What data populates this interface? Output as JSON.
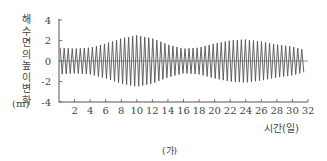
{
  "chart_data": {
    "type": "line",
    "title": "",
    "caption": "(가)",
    "xlabel": "시간(일)",
    "ylabel": "해수면의 높이 변화",
    "ylabel_unit": "(m)",
    "xlim": [
      0,
      32
    ],
    "ylim": [
      -4,
      4
    ],
    "x_ticks": [
      2,
      4,
      6,
      8,
      10,
      12,
      14,
      16,
      18,
      20,
      22,
      24,
      26,
      28,
      30,
      32
    ],
    "y_ticks": [
      4,
      2,
      0,
      -2,
      -4
    ],
    "grid": false,
    "zero_line": true,
    "series": [
      {
        "name": "해수면의 높이 변화",
        "envelope": {
          "x": [
            0,
            2,
            4,
            6,
            8,
            10,
            12,
            14,
            16,
            18,
            20,
            22,
            24,
            26,
            28,
            30,
            31.5
          ],
          "amplitude": [
            1.3,
            1.2,
            1.3,
            1.7,
            2.2,
            2.5,
            2.2,
            1.6,
            1.2,
            1.3,
            1.7,
            2.0,
            2.1,
            1.9,
            1.6,
            1.4,
            1.1
          ]
        }
      }
    ]
  }
}
